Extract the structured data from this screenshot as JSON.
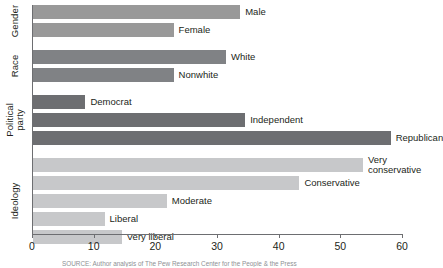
{
  "chart_data": {
    "type": "bar",
    "orientation": "horizontal",
    "title": "",
    "xlabel": "",
    "ylabel": "",
    "xlim": [
      0,
      60
    ],
    "xticks": [
      0,
      10,
      20,
      30,
      40,
      50,
      60
    ],
    "grid": false,
    "legend": false,
    "groups": [
      {
        "name": "Gender",
        "color": "#999999",
        "bars": [
          {
            "label": "Male",
            "value": 33.6
          },
          {
            "label": "Female",
            "value": 22.8
          }
        ]
      },
      {
        "name": "Race",
        "color": "#808285",
        "bars": [
          {
            "label": "White",
            "value": 31.3
          },
          {
            "label": "Nonwhite",
            "value": 22.8
          }
        ]
      },
      {
        "name": "Political\nparty",
        "color": "#6d6e71",
        "bars": [
          {
            "label": "Democrat",
            "value": 8.5
          },
          {
            "label": "Independent",
            "value": 34.4
          },
          {
            "label": "Republican",
            "value": 58.0
          }
        ]
      },
      {
        "name": "Ideology",
        "color": "#c7c8ca",
        "bars": [
          {
            "label": "Very\nconservative",
            "value": 53.5
          },
          {
            "label": "Conservative",
            "value": 43.2
          },
          {
            "label": "Moderate",
            "value": 21.7
          },
          {
            "label": "Liberal",
            "value": 11.6
          },
          {
            "label": "Very liberal",
            "value": 14.4
          }
        ]
      }
    ]
  },
  "source_note": "SOURCE: Author analysis of The Pew Research Center for the People & the Press"
}
